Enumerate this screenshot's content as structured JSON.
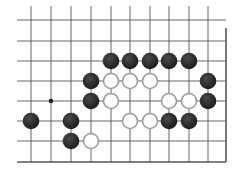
{
  "board": {
    "colors": {
      "background": "#ffffff",
      "line": "#555555",
      "black_stone": "#2b2b2b",
      "white_stone_fill": "#ffffff",
      "white_stone_stroke": "#9a9a9a",
      "star_point": "#222222"
    },
    "columns_x": [
      31,
      51,
      71,
      91,
      111,
      130,
      150,
      169,
      189,
      208
    ],
    "rows_y": [
      20,
      41,
      61,
      81,
      101,
      121,
      141,
      162
    ],
    "left_edge_x": 17,
    "right_edge_x": 226,
    "top_edge_y": 6,
    "bottom_edge_y": 162,
    "stone_radius": 8.3,
    "star_points": [
      {
        "col": 1,
        "row": 4
      }
    ],
    "stones": [
      {
        "color": "black",
        "col": 4,
        "row": 2
      },
      {
        "color": "black",
        "col": 5,
        "row": 2
      },
      {
        "color": "black",
        "col": 6,
        "row": 2
      },
      {
        "color": "black",
        "col": 7,
        "row": 2
      },
      {
        "color": "black",
        "col": 8,
        "row": 2
      },
      {
        "color": "black",
        "col": 3,
        "row": 3
      },
      {
        "color": "white",
        "col": 4,
        "row": 3
      },
      {
        "color": "white",
        "col": 5,
        "row": 3
      },
      {
        "color": "white",
        "col": 6,
        "row": 3
      },
      {
        "color": "black",
        "col": 9,
        "row": 3
      },
      {
        "color": "black",
        "col": 3,
        "row": 4
      },
      {
        "color": "white",
        "col": 4,
        "row": 4
      },
      {
        "color": "white",
        "col": 7,
        "row": 4
      },
      {
        "color": "white",
        "col": 8,
        "row": 4
      },
      {
        "color": "black",
        "col": 9,
        "row": 4
      },
      {
        "color": "black",
        "col": 0,
        "row": 5
      },
      {
        "color": "black",
        "col": 2,
        "row": 5
      },
      {
        "color": "white",
        "col": 5,
        "row": 5
      },
      {
        "color": "white",
        "col": 6,
        "row": 5
      },
      {
        "color": "black",
        "col": 7,
        "row": 5
      },
      {
        "color": "black",
        "col": 8,
        "row": 5
      },
      {
        "color": "black",
        "col": 2,
        "row": 6
      },
      {
        "color": "white",
        "col": 3,
        "row": 6
      }
    ]
  }
}
